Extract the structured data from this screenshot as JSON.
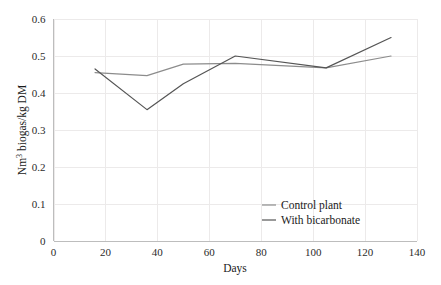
{
  "chart_data": {
    "type": "line",
    "title": "",
    "xlabel": "Days",
    "ylabel": "Nm3 biogas/kg DM",
    "ylabel_parts": {
      "prefix": "Nm",
      "superscript": "3",
      "suffix": " biogas/kg DM"
    },
    "xlim": [
      0,
      140
    ],
    "ylim": [
      0,
      0.6
    ],
    "xticks": [
      0,
      20,
      40,
      60,
      80,
      100,
      120,
      140
    ],
    "xtick_labels": [
      "0",
      "20",
      "40",
      "60",
      "80",
      "100",
      "120",
      "140"
    ],
    "yticks": [
      0,
      0.1,
      0.2,
      0.3,
      0.4,
      0.5,
      0.6
    ],
    "ytick_labels": [
      "0",
      "0.1",
      "0.2",
      "0.3",
      "0.4",
      "0.5",
      "0.6"
    ],
    "grid": true,
    "grid_axes": "both",
    "legend_position": "inside-lower-right",
    "series": [
      {
        "name": "Control plant",
        "color": "#8c8c8c",
        "x": [
          16,
          36,
          50,
          70,
          105,
          130
        ],
        "values": [
          0.455,
          0.447,
          0.478,
          0.48,
          0.468,
          0.5
        ]
      },
      {
        "name": "With bicarbonate",
        "color": "#555555",
        "x": [
          16,
          36,
          50,
          70,
          105,
          130
        ],
        "values": [
          0.465,
          0.355,
          0.425,
          0.5,
          0.468,
          0.55
        ]
      }
    ]
  },
  "legend": {
    "items": [
      {
        "label": "Control plant"
      },
      {
        "label": "With bicarbonate"
      }
    ]
  },
  "colors": {
    "background": "#ffffff",
    "grid": "#eceaea",
    "axis": "#bdbdbd",
    "text": "#1a1a1a",
    "series_1": "#8c8c8c",
    "series_2": "#555555"
  }
}
